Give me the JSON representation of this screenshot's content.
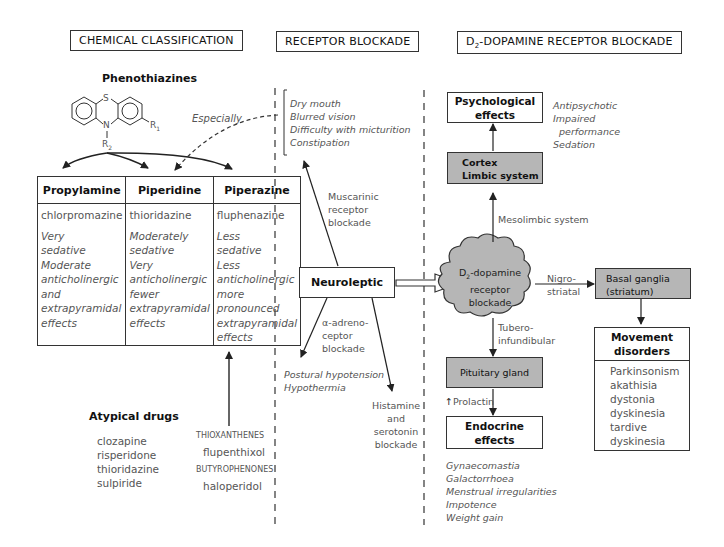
{
  "headers": {
    "chemical": "CHEMICAL CLASSIFICATION",
    "receptor": "RECEPTOR BLOCKADE",
    "d2_prefix": "D",
    "d2_sub": "2",
    "d2_rest": "-DOPAMINE RECEPTOR BLOCKADE"
  },
  "phenothiazines": {
    "title": "Phenothiazines",
    "atom_s": "S",
    "atom_n": "N",
    "r1": "R",
    "r1_sub": "1",
    "r2": "R",
    "r2_sub": "2",
    "especially": "Especially"
  },
  "table": {
    "columns": [
      {
        "header": "Propylamine",
        "drug": "chlorpromazine",
        "effects": [
          "Very",
          "sedative",
          "Moderate",
          "anticholinergic",
          "and",
          "extrapyramidal",
          "effects"
        ]
      },
      {
        "header": "Piperidine",
        "drug": "thioridazine",
        "effects": [
          "Moderately",
          "sedative",
          "Very",
          "anticholinergic",
          "fewer",
          "extrapyramidal",
          "effects"
        ]
      },
      {
        "header": "Piperazine",
        "drug": "fluphenazine",
        "effects": [
          "Less",
          "sedative",
          "Less",
          "anticholinergic",
          "more",
          "pronounced",
          "extrapyramidal",
          "effects"
        ]
      }
    ]
  },
  "atypical": {
    "title": "Atypical drugs",
    "drugs": [
      "clozapine",
      "risperidone",
      "thioridazine",
      "sulpiride"
    ]
  },
  "other_classes": {
    "thioxanthenes": "THIOXANTHENES",
    "thioxanthenes_drug": "flupenthixol",
    "butyrophenones": "BUTYROPHENONES",
    "butyrophenones_drug": "haloperidol"
  },
  "receptor_blockade": {
    "anticholinergic_effects": [
      "Dry mouth",
      "Blurred vision",
      "Difficulty with micturition",
      "Constipation"
    ],
    "muscarinic": [
      "Muscarinic",
      "receptor",
      "blockade"
    ],
    "neuroleptic": "Neuroleptic",
    "alpha": [
      "α-adreno-",
      "ceptor",
      "blockade"
    ],
    "alpha_effects": [
      "Postural hypotension",
      "Hypothermia"
    ],
    "histamine": [
      "Histamine",
      "and",
      "serotonin",
      "blockade"
    ]
  },
  "d2": {
    "psychological": [
      "Psychological",
      "effects"
    ],
    "psych_effects": [
      "Antipsychotic",
      "Impaired",
      "performance",
      "Sedation"
    ],
    "cortex": [
      "Cortex",
      "Limbic system"
    ],
    "mesolimbic": "Mesolimbic system",
    "cloud_prefix": "D",
    "cloud_sub": "2",
    "cloud_rest": "-dopamine",
    "cloud_lines": [
      "receptor",
      "blockade"
    ],
    "nigro": [
      "Nigro-",
      "striatal"
    ],
    "basal": [
      "Basal ganglia",
      "(striatum)"
    ],
    "movement": [
      "Movement",
      "disorders"
    ],
    "movement_list": [
      "Parkinsonism",
      "akathisia",
      "dystonia",
      "dyskinesia",
      "tardive",
      "dyskinesia"
    ],
    "tubero": [
      "Tubero-",
      "infundibular"
    ],
    "pituitary": "Pituitary gland",
    "prolactin_arrow": "↑",
    "prolactin": "Prolactin",
    "endocrine": [
      "Endocrine",
      "effects"
    ],
    "endocrine_list": [
      "Gynaecomastia",
      "Galactorrhoea",
      "Menstrual irregularities",
      "Impotence",
      "Weight gain"
    ]
  },
  "colors": {
    "gray_box": "#b6b6b6",
    "line": "#222222",
    "text_gray": "#555555"
  }
}
